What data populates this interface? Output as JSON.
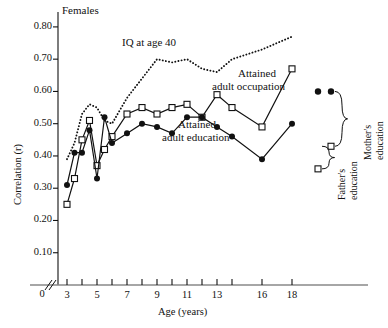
{
  "figure": {
    "panel_label": "Females",
    "ylabel": "Correlation (r)",
    "xlabel": "Age (years)",
    "zero_label": "0"
  },
  "annotations": {
    "iq": "IQ at age 40",
    "occupation_line1": "Attained",
    "occupation_line2": "adult occupation",
    "education_line1": "Attained",
    "education_line2": "adult education",
    "fathers_line1": "Father's",
    "fathers_line2": "education",
    "mothers_line1": "Mother's",
    "mothers_line2": "education"
  },
  "chart_data": {
    "type": "line",
    "title": "Females",
    "xlabel": "Age (years)",
    "ylabel": "Correlation (r)",
    "xlim": [
      2.4,
      19.2
    ],
    "ylim": [
      0.0,
      0.84
    ],
    "yticks": [
      0.1,
      0.2,
      0.3,
      0.4,
      0.5,
      0.6,
      0.7,
      0.8
    ],
    "ytick_labels": [
      "0.10",
      "0.20",
      "0.30",
      "0.40",
      "0.50",
      "0.60",
      "0.70",
      "0.80"
    ],
    "xticks": [
      3,
      4,
      5,
      6,
      7,
      8,
      9,
      10,
      11,
      12,
      13,
      14,
      16,
      18
    ],
    "xtick_labels": [
      "3",
      "",
      "5",
      "",
      "7",
      "",
      "9",
      "",
      "11",
      "",
      "13",
      "",
      "16",
      "18"
    ],
    "axis_break": true,
    "grid": false,
    "legend": "inline annotations",
    "series": [
      {
        "name": "IQ at age 40",
        "style": "dotted",
        "marker": "none",
        "x": [
          3,
          3.5,
          4,
          4.5,
          5,
          5.5,
          6,
          7,
          8,
          9,
          10,
          11,
          12,
          13,
          14,
          16,
          18
        ],
        "values": [
          0.39,
          0.44,
          0.53,
          0.56,
          0.55,
          0.51,
          0.5,
          0.58,
          0.64,
          0.7,
          0.69,
          0.7,
          0.67,
          0.66,
          0.7,
          0.73,
          0.77
        ]
      },
      {
        "name": "Attained adult occupation",
        "style": "solid",
        "marker": "open-square",
        "x": [
          3,
          3.5,
          4,
          4.5,
          5,
          5.5,
          6,
          7,
          8,
          9,
          10,
          11,
          12,
          13,
          14,
          16,
          18
        ],
        "values": [
          0.25,
          0.33,
          0.45,
          0.51,
          0.37,
          0.42,
          0.46,
          0.53,
          0.55,
          0.53,
          0.55,
          0.56,
          0.52,
          0.59,
          0.55,
          0.49,
          0.67
        ]
      },
      {
        "name": "Attained adult education",
        "style": "solid",
        "marker": "filled-circle",
        "x": [
          3,
          3.5,
          4,
          4.5,
          5,
          5.5,
          6,
          7,
          8,
          9,
          10,
          11,
          12,
          13,
          14,
          16,
          18
        ],
        "values": [
          0.31,
          0.41,
          0.41,
          0.48,
          0.33,
          0.52,
          0.44,
          0.47,
          0.5,
          0.49,
          0.47,
          0.52,
          0.52,
          0.49,
          0.46,
          0.39,
          0.5
        ]
      }
    ],
    "reference_points": [
      {
        "name": "Mother's education (occupation)",
        "marker": "filled-circle",
        "value": 0.6
      },
      {
        "name": "Mother's education (education)",
        "marker": "filled-circle",
        "value": 0.6
      },
      {
        "name": "Father's education (occupation)",
        "marker": "open-square",
        "value": 0.43
      },
      {
        "name": "Father's education (education)",
        "marker": "open-square",
        "value": 0.36
      }
    ]
  }
}
